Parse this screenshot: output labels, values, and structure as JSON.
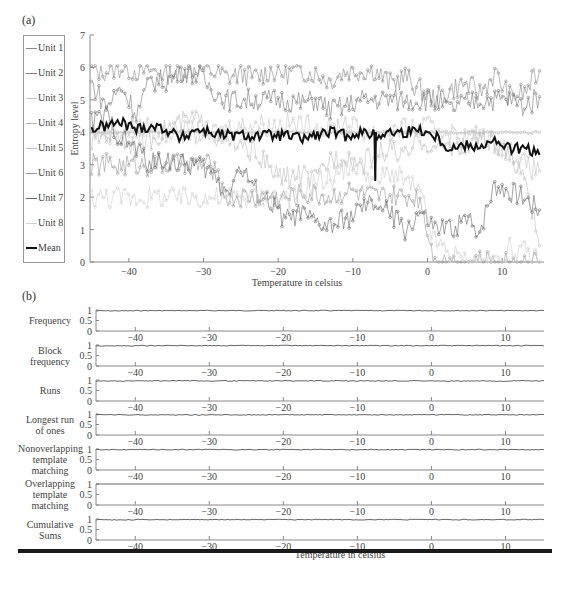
{
  "panel_a": {
    "label": "(a)",
    "ylabel": "Entropy level",
    "xlabel": "Temperature in celsius",
    "legend": [
      {
        "name": "Unit 1",
        "color": "#8a8a8a",
        "marker": "triangle"
      },
      {
        "name": "Unit 2",
        "color": "#7a7a7a",
        "marker": "circle"
      },
      {
        "name": "Unit 3",
        "color": "#c8c8c8",
        "marker": "dot"
      },
      {
        "name": "Unit 4",
        "color": "#b8b8b8",
        "marker": "square"
      },
      {
        "name": "Unit 5",
        "color": "#c0c0c0",
        "marker": "diamond"
      },
      {
        "name": "Unit 6",
        "color": "#9a9a9a",
        "marker": "circle"
      },
      {
        "name": "Unit 7",
        "color": "#6a6a6a",
        "marker": "triangle"
      },
      {
        "name": "Unit 8",
        "color": "#d0d0d0",
        "marker": "plus"
      },
      {
        "name": "Mean",
        "color": "#111111",
        "marker": "none"
      }
    ]
  },
  "panel_b": {
    "label": "(b)",
    "xlabel": "Temperature in celsius",
    "subplots": [
      {
        "label": "Frequency"
      },
      {
        "label": "Block\nfrequency"
      },
      {
        "label": "Runs"
      },
      {
        "label": "Longest run\nof ones"
      },
      {
        "label": "Nonoverlapping\ntemplate\nmatching"
      },
      {
        "label": "Overlapping\ntemplate\nmatching"
      },
      {
        "label": "Cumulative\nSums"
      }
    ],
    "ytick_labels": [
      "1",
      "0.5",
      "0"
    ]
  },
  "chart_data": [
    {
      "type": "line",
      "title": "(a)",
      "xlabel": "Temperature in celsius",
      "ylabel": "Entropy level",
      "xlim": [
        -45.2,
        15.6
      ],
      "ylim": [
        0,
        7
      ],
      "xticks": [
        -40,
        -30,
        -20,
        -10,
        0,
        10
      ],
      "yticks": [
        0,
        1,
        2,
        3,
        4,
        5,
        6,
        7
      ],
      "grid": false,
      "legend_position": "left-outside",
      "x": [
        -45,
        -43,
        -41,
        -39,
        -37,
        -35,
        -33,
        -31,
        -29,
        -27,
        -25,
        -23,
        -21,
        -19,
        -17,
        -15,
        -13,
        -11,
        -9,
        -7,
        -5,
        -3,
        -1,
        1,
        3,
        5,
        7,
        9,
        11,
        13,
        15
      ],
      "series": [
        {
          "name": "Unit 1",
          "values": [
            5.9,
            5.9,
            6.0,
            5.9,
            5.9,
            5.8,
            5.9,
            6.0,
            5.9,
            5.7,
            5.8,
            5.7,
            5.9,
            5.8,
            5.9,
            5.8,
            5.6,
            5.9,
            5.9,
            5.9,
            5.5,
            5.7,
            5.3,
            5.0,
            5.3,
            5.5,
            5.2,
            5.8,
            5.1,
            5.2,
            5.9
          ]
        },
        {
          "name": "Unit 2",
          "values": [
            5.5,
            4.8,
            5.4,
            4.6,
            5.6,
            5.6,
            5.9,
            5.8,
            5.4,
            5.0,
            5.0,
            5.0,
            5.0,
            5.0,
            4.9,
            5.0,
            4.7,
            4.8,
            5.0,
            5.0,
            5.0,
            5.0,
            5.0,
            5.0,
            4.7,
            4.9,
            5.0,
            5.0,
            5.0,
            4.8,
            5.1
          ]
        },
        {
          "name": "Unit 3",
          "values": [
            4.1,
            4.0,
            4.0,
            4.1,
            4.1,
            4.0,
            4.0,
            4.0,
            4.0,
            4.1,
            4.2,
            4.3,
            4.2,
            4.3,
            4.2,
            4.2,
            4.1,
            4.3,
            4.1,
            4.0,
            4.0,
            4.1,
            4.1,
            4.2,
            4.0,
            3.8,
            3.9,
            3.7,
            3.5,
            3.0,
            2.8
          ]
        },
        {
          "name": "Unit 4",
          "values": [
            4.0,
            4.0,
            4.0,
            4.0,
            4.0,
            4.0,
            4.0,
            4.0,
            4.0,
            4.0,
            4.0,
            4.0,
            4.0,
            4.0,
            4.0,
            4.0,
            4.0,
            4.0,
            4.0,
            4.0,
            4.0,
            4.0,
            4.0,
            4.0,
            4.0,
            4.0,
            4.0,
            4.0,
            4.0,
            4.0,
            4.0
          ]
        },
        {
          "name": "Unit 5",
          "values": [
            3.7,
            4.0,
            3.8,
            3.6,
            3.8,
            4.1,
            4.3,
            4.4,
            4.0,
            3.7,
            3.5,
            3.4,
            2.8,
            2.6,
            2.7,
            2.5,
            3.2,
            3.3,
            3.0,
            3.3,
            3.5,
            3.2,
            3.8,
            3.5,
            3.6,
            3.5,
            3.9,
            3.6,
            3.2,
            2.8,
            0.5
          ]
        },
        {
          "name": "Unit 6",
          "values": [
            3.0,
            3.0,
            3.0,
            3.0,
            3.0,
            3.0,
            3.0,
            3.0,
            3.0,
            2.0,
            2.0,
            2.0,
            2.0,
            2.0,
            2.1,
            2.1,
            2.0,
            2.2,
            2.1,
            2.0,
            2.0,
            2.0,
            2.0,
            0.0,
            0.0,
            0.0,
            0.0,
            0.0,
            0.0,
            0.0,
            0.0
          ]
        },
        {
          "name": "Unit 7",
          "values": [
            4.3,
            4.5,
            3.8,
            3.5,
            3.0,
            3.2,
            3.0,
            3.0,
            2.8,
            2.2,
            2.9,
            2.2,
            1.8,
            1.3,
            1.5,
            1.2,
            1.1,
            1.3,
            1.6,
            1.8,
            1.5,
            1.0,
            1.5,
            1.0,
            1.0,
            1.3,
            1.0,
            2.4,
            2.2,
            2.0,
            1.6
          ]
        },
        {
          "name": "Unit 8",
          "values": [
            2.0,
            2.0,
            2.0,
            2.0,
            2.0,
            2.0,
            2.0,
            2.0,
            2.0,
            2.0,
            2.0,
            2.0,
            2.0,
            2.0,
            2.1,
            2.5,
            2.6,
            2.9,
            3.0,
            2.4,
            2.8,
            2.5,
            2.1,
            0.6,
            0.3,
            0.0,
            0.0,
            0.0,
            0.4,
            0.3,
            0.0
          ]
        },
        {
          "name": "Mean",
          "values": [
            4.1,
            4.2,
            4.3,
            4.1,
            4.2,
            4.1,
            3.8,
            4.1,
            4.0,
            3.9,
            3.9,
            3.9,
            3.9,
            3.9,
            3.8,
            3.9,
            4.0,
            3.9,
            4.0,
            3.9,
            4.0,
            4.0,
            4.1,
            3.9,
            3.5,
            3.6,
            3.6,
            3.7,
            3.5,
            3.5,
            3.3
          ]
        }
      ],
      "annotations": [
        {
          "text": "Mean dips to ~2.5 near -7 °C",
          "x": -7,
          "y": 2.5
        }
      ]
    },
    {
      "type": "line",
      "title": "(b)",
      "xlabel": "Temperature in celsius",
      "xlim": [
        -45.3,
        15.2
      ],
      "ylim": [
        0,
        1
      ],
      "xticks": [
        -40,
        -30,
        -20,
        -10,
        0,
        10
      ],
      "yticks": [
        0,
        0.5,
        1
      ],
      "grid": false,
      "x": [
        -45,
        -35,
        -25,
        -15,
        -5,
        5,
        15
      ],
      "series": [
        {
          "name": "Frequency",
          "values": [
            0.98,
            0.99,
            0.99,
            0.99,
            0.99,
            0.99,
            0.99
          ]
        },
        {
          "name": "Block frequency",
          "values": [
            0.98,
            0.99,
            0.99,
            0.99,
            0.99,
            0.99,
            0.99
          ]
        },
        {
          "name": "Runs",
          "values": [
            0.97,
            0.98,
            0.98,
            0.98,
            0.98,
            0.97,
            0.98
          ]
        },
        {
          "name": "Longest run of ones",
          "values": [
            0.98,
            0.98,
            0.98,
            0.98,
            0.98,
            0.98,
            0.98
          ]
        },
        {
          "name": "Nonoverlapping template matching",
          "values": [
            0.99,
            0.99,
            0.99,
            0.99,
            0.99,
            0.99,
            0.99
          ]
        },
        {
          "name": "Overlapping template matching",
          "values": [
            1.0,
            1.0,
            1.0,
            1.0,
            1.0,
            1.0,
            1.0
          ]
        },
        {
          "name": "Cumulative Sums",
          "values": [
            0.98,
            0.99,
            0.99,
            0.99,
            0.99,
            0.99,
            0.99
          ]
        }
      ]
    }
  ]
}
